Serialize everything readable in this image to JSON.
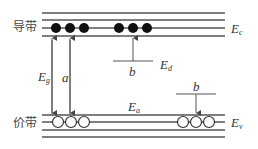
{
  "diagram": {
    "bands": {
      "conduction": {
        "label": "导带",
        "energy_label": "E",
        "energy_sub": "c"
      },
      "valence": {
        "label": "价带",
        "energy_label": "E",
        "energy_sub": "v"
      }
    },
    "levels": {
      "donor": {
        "label": "E",
        "sub": "d"
      },
      "acceptor": {
        "label": "E",
        "sub": "a"
      }
    },
    "transitions": {
      "gap": {
        "label": "E",
        "sub": "g"
      },
      "a": {
        "label": "a"
      },
      "b_donor": {
        "label": "b"
      },
      "b_acceptor": {
        "label": "b"
      }
    },
    "colors": {
      "line": "#555555",
      "electron": "#111111",
      "hole_fill": "#ffffff",
      "hole_stroke": "#333333"
    }
  }
}
